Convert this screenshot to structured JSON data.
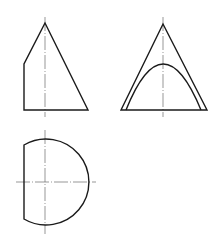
{
  "diagram": {
    "type": "orthographic-projection",
    "colors": {
      "outline": "#1a1a1a",
      "centerline": "#6a6a6a",
      "background": "#ffffff"
    },
    "views": [
      {
        "name": "front-view",
        "shape": "cone silhouette with vertical cut on left"
      },
      {
        "name": "side-view",
        "shape": "triangle with parabolic section curve"
      },
      {
        "name": "top-view",
        "shape": "circle truncated by vertical chord"
      }
    ]
  }
}
